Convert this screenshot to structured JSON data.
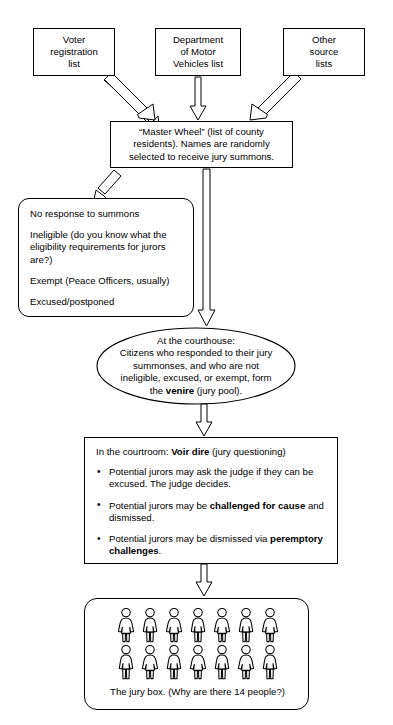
{
  "diagram": {
    "ink_color": "#000000",
    "background_color": "#ffffff"
  },
  "sources": [
    {
      "id": "voter-registration-list",
      "lines": [
        "Voter",
        "registration",
        "list"
      ]
    },
    {
      "id": "dmv-list",
      "lines": [
        "Department",
        "of Motor",
        "Vehicles list"
      ]
    },
    {
      "id": "other-source-lists",
      "lines": [
        "Other",
        "source",
        "lists"
      ]
    }
  ],
  "master_wheel": {
    "lines": [
      "“Master Wheel” (list of county",
      "residents). Names are randomly",
      "selected to receive jury summons."
    ]
  },
  "exclusions": {
    "items": [
      "No response to summons",
      "Ineligible (do you know what the eligibility requirements for jurors are?)",
      "Exempt (Peace Officers, usually)",
      "Excused/postponed"
    ]
  },
  "venire": {
    "line1": "At the courthouse:",
    "line2": "Citizens who responded to their jury",
    "line3": "summonses, and who are not",
    "line4": "ineligible, excused, or exempt, form",
    "line5_pre": "the ",
    "line5_bold": "venire",
    "line5_post": " (jury pool)."
  },
  "voir_dire": {
    "header_pre": "In the courtroom: ",
    "header_bold": "Voir dire",
    "header_post": " (jury questioning)",
    "bullet_glyph": "•",
    "bullets": [
      {
        "pre": "Potential jurors may ask the judge if they can be excused.  The judge decides.",
        "bold": "",
        "post": ""
      },
      {
        "pre": "Potential jurors may be ",
        "bold": "challenged for cause",
        "post": " and dismissed."
      },
      {
        "pre": "Potential jurors may be dismissed via ",
        "bold": "peremptory challenges",
        "post": "."
      }
    ]
  },
  "jury_box": {
    "caption": "The jury box. (Why are there 14 people?)",
    "person_count": 14,
    "rows": 2,
    "per_row": 7,
    "row1_types": [
      "skirt",
      "pants",
      "skirt",
      "pants",
      "skirt",
      "pants",
      "skirt"
    ],
    "row2_types": [
      "pants",
      "skirt",
      "pants",
      "skirt",
      "pants",
      "skirt",
      "pants"
    ]
  },
  "connectors": [
    {
      "id": "voter-to-master",
      "kind": "diagonal-block-arrow",
      "from": "voter-registration-list",
      "to": "master-wheel"
    },
    {
      "id": "dmv-to-master",
      "kind": "vertical-block-arrow",
      "from": "dmv-list",
      "to": "master-wheel"
    },
    {
      "id": "other-to-master",
      "kind": "diagonal-block-arrow",
      "from": "other-source-lists",
      "to": "master-wheel"
    },
    {
      "id": "master-to-exclusions",
      "kind": "diagonal-block-arrow",
      "from": "master-wheel",
      "to": "exclusions"
    },
    {
      "id": "master-to-venire",
      "kind": "long-vertical-block-arrow",
      "from": "master-wheel",
      "to": "venire"
    },
    {
      "id": "venire-to-voir-dire",
      "kind": "vertical-block-arrow",
      "from": "venire",
      "to": "voir-dire"
    },
    {
      "id": "voir-dire-to-jury-box",
      "kind": "vertical-block-arrow",
      "from": "voir-dire",
      "to": "jury-box"
    }
  ]
}
